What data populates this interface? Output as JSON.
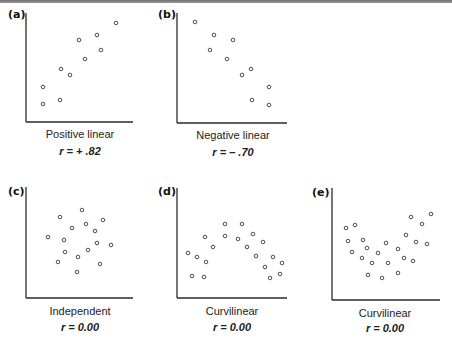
{
  "chart_data": [
    {
      "type": "scatter",
      "panel": "(a)",
      "title": "Positive linear",
      "annotation": "r = + .82",
      "r": 0.82,
      "xlabel": "",
      "ylabel": "",
      "xlim": [
        0,
        107
      ],
      "ylim": [
        0,
        109
      ],
      "grid": false,
      "points": [
        [
          17,
          35
        ],
        [
          17,
          18
        ],
        [
          34,
          22
        ],
        [
          35,
          53
        ],
        [
          44,
          47
        ],
        [
          53,
          82
        ],
        [
          59,
          63
        ],
        [
          71,
          87
        ],
        [
          75,
          72
        ],
        [
          90,
          99
        ]
      ]
    },
    {
      "type": "scatter",
      "panel": "(b)",
      "title": "Negative linear",
      "annotation": "r = – .70",
      "r": -0.7,
      "xlabel": "",
      "ylabel": "",
      "xlim": [
        0,
        110
      ],
      "ylim": [
        0,
        110
      ],
      "grid": false,
      "points": [
        [
          18,
          101
        ],
        [
          37,
          88
        ],
        [
          33,
          73
        ],
        [
          56,
          83
        ],
        [
          50,
          64
        ],
        [
          65,
          48
        ],
        [
          74,
          54
        ],
        [
          92,
          36
        ],
        [
          75,
          23
        ],
        [
          92,
          18
        ]
      ]
    },
    {
      "type": "scatter",
      "panel": "(c)",
      "title": "Independent",
      "annotation": "r = 0.00",
      "r": 0.0,
      "xlabel": "",
      "ylabel": "",
      "xlim": [
        0,
        107
      ],
      "ylim": [
        0,
        111
      ],
      "grid": false,
      "points": [
        [
          22,
          61
        ],
        [
          34,
          81
        ],
        [
          38,
          58
        ],
        [
          32,
          36
        ],
        [
          39,
          46
        ],
        [
          46,
          70
        ],
        [
          51,
          26
        ],
        [
          52,
          41
        ],
        [
          56,
          88
        ],
        [
          60,
          74
        ],
        [
          62,
          48
        ],
        [
          69,
          67
        ],
        [
          71,
          55
        ],
        [
          74,
          34
        ],
        [
          77,
          78
        ],
        [
          85,
          53
        ]
      ]
    },
    {
      "type": "scatter",
      "panel": "(d)",
      "title": "Curvilinear",
      "annotation": "r = 0.00",
      "r": 0.0,
      "xlabel": "",
      "ylabel": "",
      "xlim": [
        0,
        110
      ],
      "ylim": [
        0,
        110
      ],
      "grid": false,
      "points": [
        [
          11,
          45
        ],
        [
          15,
          22
        ],
        [
          20,
          41
        ],
        [
          27,
          21
        ],
        [
          29,
          36
        ],
        [
          28,
          61
        ],
        [
          36,
          51
        ],
        [
          48,
          74
        ],
        [
          48,
          62
        ],
        [
          65,
          74
        ],
        [
          61,
          59
        ],
        [
          70,
          51
        ],
        [
          76,
          64
        ],
        [
          79,
          42
        ],
        [
          86,
          56
        ],
        [
          88,
          31
        ],
        [
          93,
          20
        ],
        [
          96,
          41
        ],
        [
          103,
          24
        ],
        [
          105,
          35
        ]
      ]
    },
    {
      "type": "scatter",
      "panel": "(e)",
      "title": "Curvilinear",
      "annotation": "r = 0.00",
      "r": 0.0,
      "xlabel": "",
      "ylabel": "",
      "xlim": [
        0,
        108
      ],
      "ylim": [
        0,
        112
      ],
      "grid": false,
      "points": [
        [
          14,
          72
        ],
        [
          23,
          75
        ],
        [
          16,
          59
        ],
        [
          31,
          60
        ],
        [
          20,
          48
        ],
        [
          35,
          52
        ],
        [
          30,
          42
        ],
        [
          46,
          47
        ],
        [
          54,
          57
        ],
        [
          40,
          37
        ],
        [
          56,
          37
        ],
        [
          66,
          51
        ],
        [
          36,
          25
        ],
        [
          50,
          22
        ],
        [
          66,
          27
        ],
        [
          72,
          42
        ],
        [
          81,
          39
        ],
        [
          74,
          65
        ],
        [
          79,
          83
        ],
        [
          90,
          76
        ],
        [
          99,
          86
        ],
        [
          84,
          58
        ],
        [
          95,
          56
        ]
      ]
    }
  ],
  "colors": {
    "axis": "#2a2a2a",
    "marker_stroke": "#3a3a3a",
    "topbar": "#7a7a7a"
  }
}
